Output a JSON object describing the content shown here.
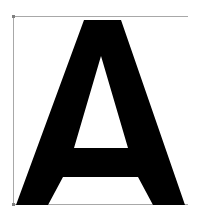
{
  "glyph": {
    "character": "A",
    "fill_color": "#000000"
  },
  "guides": {
    "color": "#a8a8a8",
    "corner_marker_color": "#808080"
  },
  "background_color": "#ffffff"
}
